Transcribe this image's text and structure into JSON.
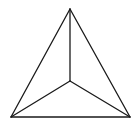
{
  "diagram": {
    "background": "#ffffff",
    "stroke_color": "#1a1a1a",
    "stroke_width": 1.3,
    "vertices": {
      "top": [
        70,
        9
      ],
      "bottom_left": [
        11,
        117
      ],
      "bottom_right": [
        130,
        117
      ],
      "center": [
        70,
        81
      ]
    },
    "edges": [
      {
        "name": "outer-edge-left",
        "from": "top",
        "to": "bottom_left"
      },
      {
        "name": "outer-edge-right",
        "from": "top",
        "to": "bottom_right"
      },
      {
        "name": "outer-edge-bottom",
        "from": "bottom_left",
        "to": "bottom_right"
      },
      {
        "name": "inner-edge-top",
        "from": "center",
        "to": "top"
      },
      {
        "name": "inner-edge-left",
        "from": "center",
        "to": "bottom_left"
      },
      {
        "name": "inner-edge-right",
        "from": "center",
        "to": "bottom_right"
      }
    ]
  }
}
